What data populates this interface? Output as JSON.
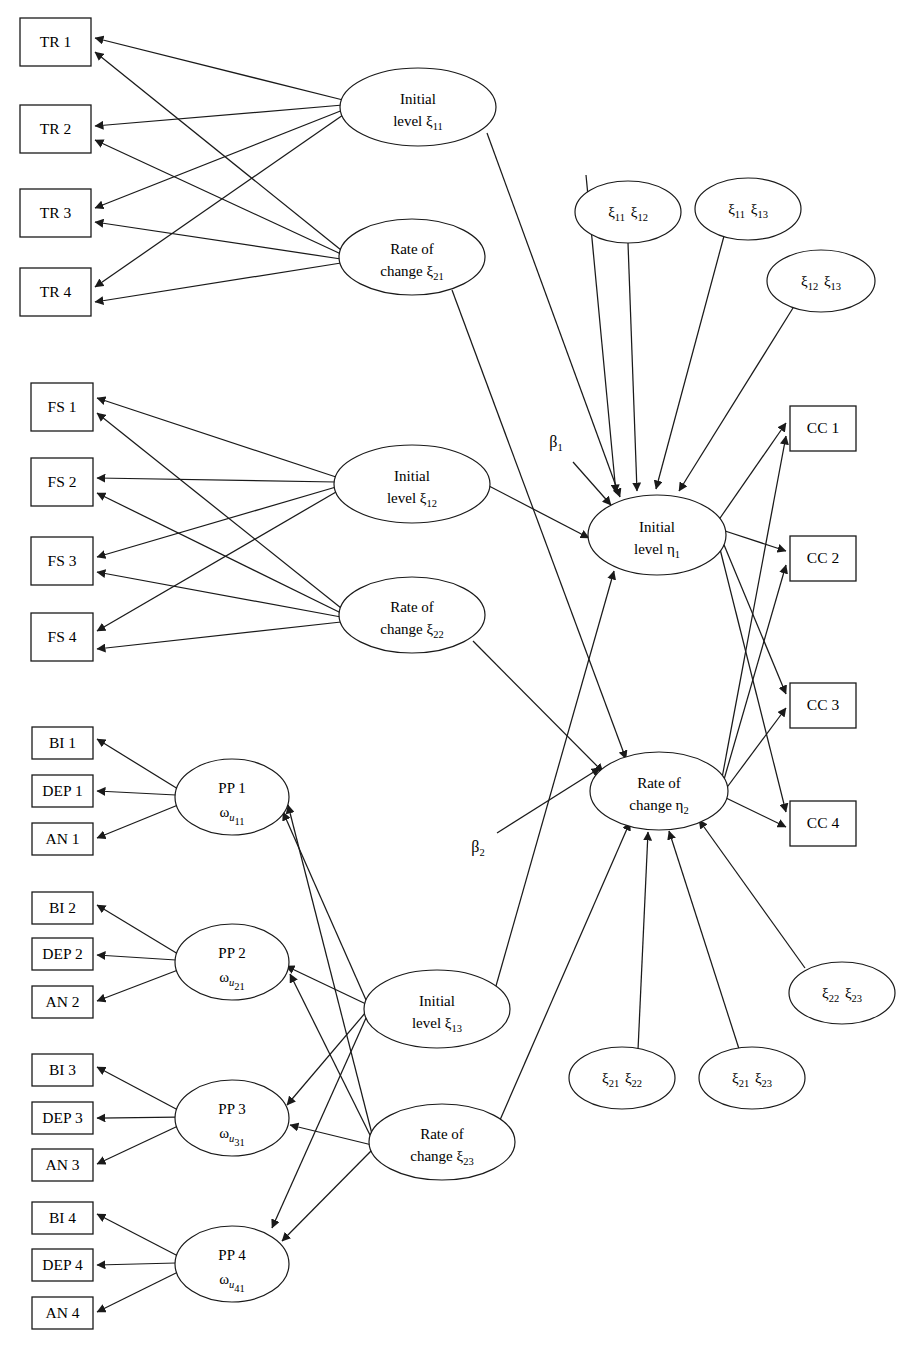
{
  "diagram": {
    "type": "path-diagram",
    "stroke_color": "#1a1a1a",
    "background": "#ffffff"
  },
  "indicators": {
    "tr": [
      {
        "id": "TR1",
        "label": "TR 1",
        "x": 20,
        "y": 18,
        "w": 71,
        "h": 48
      },
      {
        "id": "TR2",
        "label": "TR 2",
        "x": 20,
        "y": 105,
        "w": 71,
        "h": 48
      },
      {
        "id": "TR3",
        "label": "TR 3",
        "x": 20,
        "y": 189,
        "w": 71,
        "h": 48
      },
      {
        "id": "TR4",
        "label": "TR 4",
        "x": 20,
        "y": 268,
        "w": 71,
        "h": 48
      }
    ],
    "fs": [
      {
        "id": "FS1",
        "label": "FS 1",
        "x": 31,
        "y": 383,
        "w": 62,
        "h": 48
      },
      {
        "id": "FS2",
        "label": "FS 2",
        "x": 31,
        "y": 458,
        "w": 62,
        "h": 48
      },
      {
        "id": "FS3",
        "label": "FS 3",
        "x": 31,
        "y": 537,
        "w": 62,
        "h": 48
      },
      {
        "id": "FS4",
        "label": "FS 4",
        "x": 31,
        "y": 613,
        "w": 62,
        "h": 48
      }
    ],
    "cc": [
      {
        "id": "CC1",
        "label": "CC 1",
        "x": 790,
        "y": 406,
        "w": 66,
        "h": 45
      },
      {
        "id": "CC2",
        "label": "CC 2",
        "x": 790,
        "y": 536,
        "w": 66,
        "h": 45
      },
      {
        "id": "CC3",
        "label": "CC 3",
        "x": 790,
        "y": 683,
        "w": 66,
        "h": 45
      },
      {
        "id": "CC4",
        "label": "CC 4",
        "x": 790,
        "y": 801,
        "w": 66,
        "h": 45
      }
    ],
    "pp_items": [
      {
        "id": "BI1",
        "label": "BI 1",
        "x": 32,
        "y": 727,
        "w": 61,
        "h": 32
      },
      {
        "id": "DEP1",
        "label": "DEP 1",
        "x": 32,
        "y": 775,
        "w": 61,
        "h": 32
      },
      {
        "id": "AN1",
        "label": "AN 1",
        "x": 32,
        "y": 823,
        "w": 61,
        "h": 32
      },
      {
        "id": "BI2",
        "label": "BI 2",
        "x": 32,
        "y": 892,
        "w": 61,
        "h": 32
      },
      {
        "id": "DEP2",
        "label": "DEP 2",
        "x": 32,
        "y": 938,
        "w": 61,
        "h": 32
      },
      {
        "id": "AN2",
        "label": "AN 2",
        "x": 32,
        "y": 986,
        "w": 61,
        "h": 32
      },
      {
        "id": "BI3",
        "label": "BI 3",
        "x": 32,
        "y": 1054,
        "w": 61,
        "h": 32
      },
      {
        "id": "DEP3",
        "label": "DEP 3",
        "x": 32,
        "y": 1102,
        "w": 61,
        "h": 32
      },
      {
        "id": "AN3",
        "label": "AN 3",
        "x": 32,
        "y": 1149,
        "w": 61,
        "h": 32
      },
      {
        "id": "BI4",
        "label": "BI 4",
        "x": 32,
        "y": 1202,
        "w": 61,
        "h": 32
      },
      {
        "id": "DEP4",
        "label": "DEP 4",
        "x": 32,
        "y": 1249,
        "w": 61,
        "h": 32
      },
      {
        "id": "AN4",
        "label": "AN 4",
        "x": 32,
        "y": 1297,
        "w": 61,
        "h": 32
      }
    ]
  },
  "latents": {
    "growth_factors": [
      {
        "id": "xi11",
        "line1": "Initial",
        "line2": "level",
        "sym": "ξ",
        "sub": "11",
        "cx": 418,
        "cy": 107,
        "rx": 78,
        "ry": 39
      },
      {
        "id": "xi21",
        "line1": "Rate of",
        "line2": "change",
        "sym": "ξ",
        "sub": "21",
        "cx": 412,
        "cy": 257,
        "rx": 73,
        "ry": 38
      },
      {
        "id": "xi12",
        "line1": "Initial",
        "line2": "level",
        "sym": "ξ",
        "sub": "12",
        "cx": 412,
        "cy": 484,
        "rx": 78,
        "ry": 39
      },
      {
        "id": "xi22",
        "line1": "Rate of",
        "line2": "change",
        "sym": "ξ",
        "sub": "22",
        "cx": 412,
        "cy": 615,
        "rx": 73,
        "ry": 38
      },
      {
        "id": "xi13",
        "line1": "Initial",
        "line2": "level",
        "sym": "ξ",
        "sub": "13",
        "cx": 437,
        "cy": 1009,
        "rx": 73,
        "ry": 39
      },
      {
        "id": "xi23",
        "line1": "Rate of",
        "line2": "change",
        "sym": "ξ",
        "sub": "23",
        "cx": 442,
        "cy": 1142,
        "rx": 73,
        "ry": 38
      }
    ],
    "outcomes": [
      {
        "id": "eta1",
        "line1": "Initial",
        "line2": "level",
        "sym": "η",
        "sub": "1",
        "cx": 657,
        "cy": 535,
        "rx": 69,
        "ry": 40
      },
      {
        "id": "eta2",
        "line1": "Rate of",
        "line2": "change",
        "sym": "η",
        "sub": "2",
        "cx": 659,
        "cy": 791,
        "rx": 69,
        "ry": 39
      }
    ],
    "pp": [
      {
        "id": "PP1",
        "label": "PP 1",
        "sym": "ω",
        "sub_i": "u",
        "sub": "11",
        "cx": 232,
        "cy": 797,
        "rx": 57,
        "ry": 38
      },
      {
        "id": "PP2",
        "label": "PP 2",
        "sym": "ω",
        "sub_i": "u",
        "sub": "21",
        "cx": 232,
        "cy": 962,
        "rx": 57,
        "ry": 38
      },
      {
        "id": "PP3",
        "label": "PP 3",
        "sym": "ω",
        "sub_i": "u",
        "sub": "31",
        "cx": 232,
        "cy": 1118,
        "rx": 57,
        "ry": 38
      },
      {
        "id": "PP4",
        "label": "PP 4",
        "sym": "ω",
        "sub_i": "u",
        "sub": "41",
        "cx": 232,
        "cy": 1264,
        "rx": 57,
        "ry": 38
      }
    ],
    "correlations": [
      {
        "id": "c_xi11_xi12",
        "s1": "ξ",
        "sub1": "11",
        "s2": "ξ",
        "sub2": "12",
        "cx": 628,
        "cy": 212,
        "rx": 53,
        "ry": 31
      },
      {
        "id": "c_xi11_xi13",
        "s1": "ξ",
        "sub1": "11",
        "s2": "ξ",
        "sub2": "13",
        "cx": 748,
        "cy": 209,
        "rx": 53,
        "ry": 31
      },
      {
        "id": "c_xi12_xi13",
        "s1": "ξ",
        "sub1": "12",
        "s2": "ξ",
        "sub2": "13",
        "cx": 821,
        "cy": 281,
        "rx": 54,
        "ry": 31
      },
      {
        "id": "c_xi22_xi23",
        "s1": "ξ",
        "sub1": "22",
        "s2": "ξ",
        "sub2": "23",
        "cx": 842,
        "cy": 993,
        "rx": 53,
        "ry": 31
      },
      {
        "id": "c_xi21_xi22",
        "s1": "ξ",
        "sub1": "21",
        "s2": "ξ",
        "sub2": "22",
        "cx": 622,
        "cy": 1078,
        "rx": 53,
        "ry": 31
      },
      {
        "id": "c_xi21_xi23",
        "s1": "ξ",
        "sub1": "21",
        "s2": "ξ",
        "sub2": "23",
        "cx": 752,
        "cy": 1078,
        "rx": 53,
        "ry": 31
      }
    ]
  },
  "path_labels": [
    {
      "id": "beta1",
      "sym": "β",
      "sub": "1",
      "x": 556,
      "y": 447
    },
    {
      "id": "beta2",
      "sym": "β",
      "sub": "2",
      "x": 478,
      "y": 852
    }
  ],
  "legend_notes": {
    "rectangles_meaning": "observed indicator",
    "ellipses_meaning": "latent variable"
  }
}
